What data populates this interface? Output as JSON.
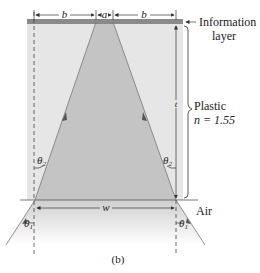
{
  "labels": {
    "b_left": "b",
    "a": "a",
    "b_right": "b",
    "information_layer_line1": "Information",
    "information_layer_line2": "layer",
    "plastic_line1": "Plastic",
    "plastic_line2": "n = 1.55",
    "theta2_left": "θ",
    "theta2_left_sub": "2",
    "theta2_right": "θ",
    "theta2_right_sub": "2",
    "theta1_left": "θ",
    "theta1_left_sub": "1",
    "theta1_right": "θ",
    "theta1_right_sub": "1",
    "w": "w",
    "t": "t",
    "air": "Air",
    "caption": "(b)"
  },
  "colors": {
    "plastic_fill": "#e6e6e6",
    "cone_fill": "#c4c4c4",
    "info_layer": "#8a8a8a",
    "line": "#333333"
  }
}
